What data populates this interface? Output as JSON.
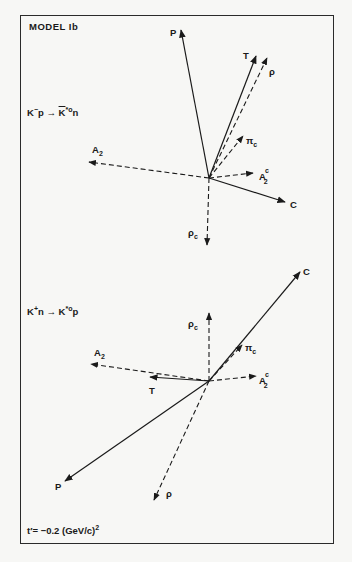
{
  "figure": {
    "title": "MODEL Ib",
    "footnote": {
      "prefix": "t′= −0.2 (GeV/c)",
      "exponent": "2"
    }
  },
  "panels": [
    {
      "id": "top",
      "reaction": {
        "base": "K",
        "sup1": "−",
        "mid": "p → ",
        "bar": "K",
        "sup2": "*o",
        "end": "n"
      },
      "origin": [
        209,
        178
      ],
      "vectors": [
        {
          "label": "P",
          "style": "solid",
          "end": [
            181,
            30
          ],
          "label_pos": [
            170,
            36
          ]
        },
        {
          "label": "T",
          "style": "solid",
          "end": [
            256,
            56
          ],
          "label_pos": [
            243,
            59
          ]
        },
        {
          "label": "ρ",
          "style": "dashed",
          "end": [
            267,
            58
          ],
          "label_pos": [
            269,
            75
          ]
        },
        {
          "label": "π",
          "sub": "c",
          "style": "dashed",
          "end": [
            243,
            136
          ],
          "label_pos": [
            246,
            144
          ]
        },
        {
          "label": "A",
          "sub": "2",
          "style": "dashed",
          "end": [
            89,
            162
          ],
          "label_pos": [
            92,
            153
          ]
        },
        {
          "label": "A",
          "sub": "2",
          "sup": "c",
          "style": "dashed",
          "end": [
            253,
            173
          ],
          "label_pos": [
            259,
            180
          ]
        },
        {
          "label": "C",
          "style": "solid",
          "end": [
            285,
            202
          ],
          "label_pos": [
            290,
            208
          ]
        },
        {
          "label": "ρ",
          "sub": "c",
          "style": "dashed",
          "end": [
            207,
            245
          ],
          "label_pos": [
            188,
            236
          ]
        }
      ]
    },
    {
      "id": "bottom",
      "reaction": {
        "base": "K",
        "sup1": "+",
        "mid": "n → ",
        "bar": "",
        "sup2": "*o",
        "end": "p"
      },
      "origin": [
        209,
        381
      ],
      "vectors": [
        {
          "label": "C",
          "style": "solid",
          "end": [
            300,
            272
          ],
          "label_pos": [
            303,
            275
          ]
        },
        {
          "label": "ρ",
          "sub": "c",
          "style": "dashed",
          "end": [
            209,
            313
          ],
          "label_pos": [
            188,
            327
          ]
        },
        {
          "label": "π",
          "sub": "c",
          "style": "dashed",
          "end": [
            242,
            345
          ],
          "label_pos": [
            245,
            351
          ]
        },
        {
          "label": "A",
          "sub": "2",
          "style": "dashed",
          "end": [
            91,
            364
          ],
          "label_pos": [
            94,
            356
          ]
        },
        {
          "label": "T",
          "style": "solid",
          "end": [
            150,
            377
          ],
          "label_pos": [
            149,
            394
          ]
        },
        {
          "label": "A",
          "sub": "2",
          "sup": "c",
          "style": "dashed",
          "end": [
            256,
            376
          ],
          "label_pos": [
            259,
            384
          ]
        },
        {
          "label": "P",
          "style": "solid",
          "end": [
            65,
            481
          ],
          "label_pos": [
            55,
            490
          ]
        },
        {
          "label": "ρ",
          "style": "dashed",
          "end": [
            154,
            500
          ],
          "label_pos": [
            166,
            497
          ]
        }
      ]
    }
  ]
}
